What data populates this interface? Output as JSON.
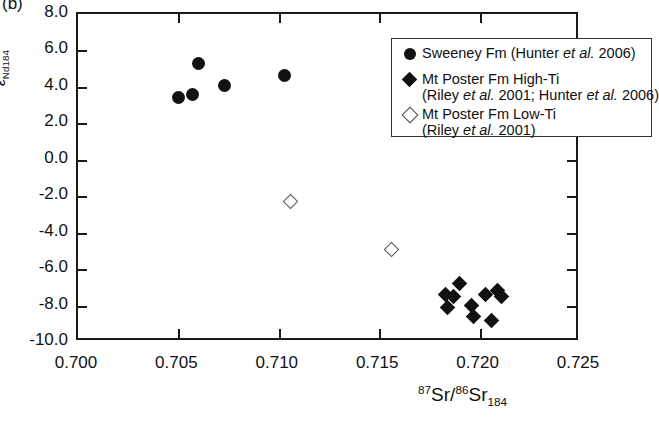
{
  "panel": {
    "label": "(b)"
  },
  "axes": {
    "y": {
      "title_main": "ε",
      "title_sub1": "Nd",
      "title_sub2": "184",
      "ticks": [
        "8.0",
        "6.0",
        "4.0",
        "2.0",
        "0.0",
        "-2.0",
        "-4.0",
        "-6.0",
        "-8.0",
        "-10.0"
      ],
      "min": -10.0,
      "max": 8.0,
      "step": 2.0
    },
    "x": {
      "title_sup1": "87",
      "title_el1": "Sr/",
      "title_sup2": "86",
      "title_el2": "Sr",
      "title_sub": "184",
      "ticks": [
        "0.700",
        "0.705",
        "0.710",
        "0.715",
        "0.720",
        "0.725"
      ],
      "min": 0.7,
      "max": 0.725,
      "step": 0.005
    }
  },
  "legend": {
    "entries": [
      {
        "symbol": "filled-circle",
        "line1": "Sweeney Fm (Hunter et al. 2006)",
        "line2": ""
      },
      {
        "symbol": "filled-diamond",
        "line1": "Mt Poster Fm High-Ti",
        "line2": "(Riley et al. 2001; Hunter et al. 2006)"
      },
      {
        "symbol": "open-diamond",
        "line1": "Mt Poster Fm Low-Ti",
        "line2": "(Riley et al. 2001)"
      }
    ]
  },
  "chart_data": {
    "type": "scatter",
    "title": "",
    "xlabel": "87Sr/86Sr184",
    "ylabel": "eNd184",
    "xlim": [
      0.7,
      0.725
    ],
    "ylim": [
      -10.0,
      8.0
    ],
    "grid": false,
    "legend_position": "top-right",
    "series": [
      {
        "name": "Sweeney Fm (Hunter et al. 2006)",
        "marker": "filled-circle",
        "color": "#111111",
        "points": [
          {
            "x": 0.706,
            "y": 5.3
          },
          {
            "x": 0.705,
            "y": 3.4
          },
          {
            "x": 0.7057,
            "y": 3.6
          },
          {
            "x": 0.7073,
            "y": 4.1
          },
          {
            "x": 0.7103,
            "y": 4.6
          }
        ]
      },
      {
        "name": "Mt Poster Fm High-Ti (Riley et al. 2001; Hunter et al. 2006)",
        "marker": "filled-diamond",
        "color": "#111111",
        "points": [
          {
            "x": 0.719,
            "y": -6.8
          },
          {
            "x": 0.7183,
            "y": -7.4
          },
          {
            "x": 0.7187,
            "y": -7.5
          },
          {
            "x": 0.7184,
            "y": -8.1
          },
          {
            "x": 0.7196,
            "y": -8.0
          },
          {
            "x": 0.7197,
            "y": -8.6
          },
          {
            "x": 0.7203,
            "y": -7.4
          },
          {
            "x": 0.7209,
            "y": -7.2
          },
          {
            "x": 0.7211,
            "y": -7.5
          },
          {
            "x": 0.7206,
            "y": -8.8
          }
        ]
      },
      {
        "name": "Mt Poster Fm Low-Ti (Riley et al. 2001)",
        "marker": "open-diamond",
        "color": "#ffffff",
        "points": [
          {
            "x": 0.7106,
            "y": -2.3
          },
          {
            "x": 0.7156,
            "y": -4.9
          }
        ]
      }
    ]
  }
}
